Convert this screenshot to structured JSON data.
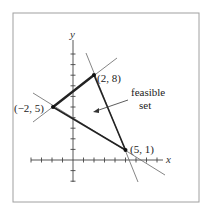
{
  "figure": {
    "axes": {
      "x_label": "x",
      "y_label": "y"
    },
    "vertices": [
      {
        "label": "(2, 8)",
        "x": 2,
        "y": 8
      },
      {
        "label": "(−2, 5)",
        "x": -2,
        "y": 5
      },
      {
        "label": "(5, 1)",
        "x": 5,
        "y": 1
      }
    ],
    "annotation": {
      "line1": "feasible",
      "line2": "set"
    },
    "colors": {
      "frame": "#9a9a9a",
      "line": "#555555",
      "edge": "#222222",
      "axis": "#444444"
    }
  }
}
